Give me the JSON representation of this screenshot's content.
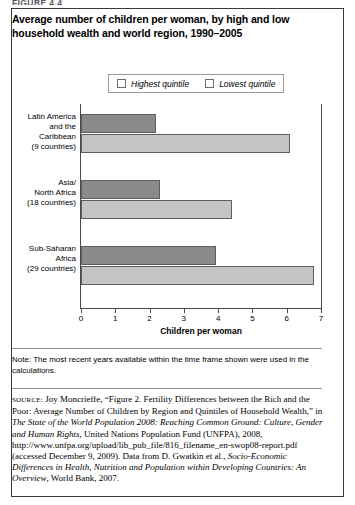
{
  "figure_label": "FIGURE 4.4",
  "chart_title": "Average number of children per woman, by high and low household wealth and world region, 1990–2005",
  "legend": {
    "items": [
      {
        "label": "Highest quintile",
        "color": "#8a8a8a",
        "name": "highest-quintile"
      },
      {
        "label": "Lowest quintile",
        "color": "#c4c4c4",
        "name": "lowest-quintile"
      }
    ]
  },
  "note": "Note: The most recent years available within the time frame shown were used in the calculations.",
  "source_prefix": "SOURCE:",
  "source_text": " Joy Moncrieffe, “Figure 2. Fertility Differences between the Rich and the Poor: Average Number of Children by Region and Quintiles of Household Wealth,” in ",
  "source_italic_1": "The State of the World Population 2008: Reaching Common Ground: Culture, Gender and Human Rights",
  "source_mid": ", United Nations Population Fund (UNFPA), 2008, http://www.unfpa.org/upload/lib_pub_file/816_filename_en-swop08-report.pdf (accessed December 9, 2009). Data from D. Gwatkin et al., ",
  "source_italic_2": "Socio-Economic Differences in Health, Nutrition and Population within Developing Countries: An Overview",
  "source_end": ", World Bank, 2007.",
  "chart_data": {
    "type": "bar",
    "orientation": "horizontal",
    "title": "Average number of children per woman, by high and low household wealth and world region, 1990–2005",
    "xlabel": "Children per woman",
    "ylabel": "",
    "xlim": [
      0,
      7
    ],
    "xticks": [
      0,
      1,
      2,
      3,
      4,
      5,
      6,
      7
    ],
    "grid": false,
    "legend_position": "top-center",
    "categories": [
      "Latin America and the Caribbean (9 countries)",
      "Asia/ North Africa (18 countries)",
      "Sub-Saharan Africa (29 countries)"
    ],
    "category_lines": [
      [
        "Latin America",
        "and the",
        "Caribbean",
        "(9 countries)"
      ],
      [
        "Asia/",
        "North Africa",
        "(18 countries)"
      ],
      [
        "Sub-Saharan",
        "Africa",
        "(29 countries)"
      ]
    ],
    "series": [
      {
        "name": "Highest quintile",
        "color": "#8a8a8a",
        "values": [
          2.2,
          2.3,
          3.95
        ]
      },
      {
        "name": "Lowest quintile",
        "color": "#c4c4c4",
        "values": [
          6.1,
          4.4,
          6.8
        ]
      }
    ]
  }
}
